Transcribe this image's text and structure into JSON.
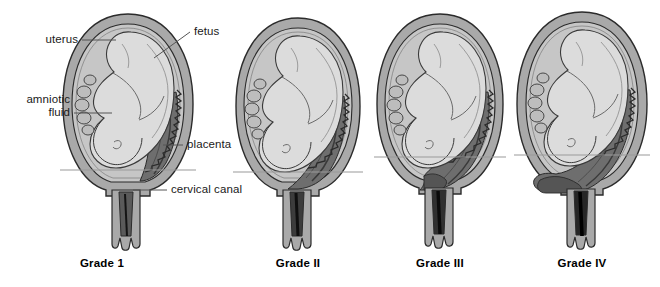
{
  "figure": {
    "background": "#ffffff",
    "panel_count": 4
  },
  "labels": [
    {
      "id": "uterus",
      "text": "uterus",
      "x": 22,
      "y": 36,
      "align": "right",
      "width": 56
    },
    {
      "id": "amniotic",
      "text": "amniotic",
      "x": 8,
      "y": 96,
      "align": "right",
      "width": 62
    },
    {
      "id": "fluid",
      "text": "fluid",
      "x": 8,
      "y": 109,
      "align": "right",
      "width": 62
    },
    {
      "id": "fetus",
      "text": "fetus",
      "x": 193,
      "y": 28,
      "align": "left",
      "width": 40
    },
    {
      "id": "placenta",
      "text": "placenta",
      "x": 186,
      "y": 140,
      "align": "left",
      "width": 60
    },
    {
      "id": "cervical-canal",
      "text": "cervical canal",
      "x": 170,
      "y": 186,
      "align": "left",
      "width": 86
    }
  ],
  "captions": [
    {
      "id": "grade-1",
      "text": "Grade 1",
      "x": 102,
      "y": 263
    },
    {
      "id": "grade-2",
      "text": "Grade II",
      "x": 272,
      "y": 263
    },
    {
      "id": "grade-3",
      "text": "Grade III",
      "x": 414,
      "y": 263
    },
    {
      "id": "grade-4",
      "text": "Grade IV",
      "x": 556,
      "y": 263
    }
  ],
  "colors": {
    "uterus_wall": "#a9a9a9",
    "uterus_wall_dark": "#8f8f8f",
    "amniotic_fluid": "#c8c8c8",
    "fetus": "#dcdcdc",
    "placenta": "#6e6e6e",
    "placenta_dark": "#4a4a4a",
    "cervical_plug": "#1a1a1a",
    "outline": "#2b2b2b",
    "leader_line": "#555555",
    "reference_line": "#9a9a9a",
    "background": "#ffffff"
  },
  "panels": [
    {
      "id": "panel-grade-1",
      "caption": "Grade 1",
      "cx": 128,
      "reference_line_y": 170,
      "placenta_reaches_os": false,
      "description": "Placenta low in uterus but clear of the internal cervical os"
    },
    {
      "id": "panel-grade-2",
      "caption": "Grade II",
      "cx": 298,
      "reference_line_y": 172,
      "placenta_reaches_os": true,
      "description": "Placenta reaches the margin of the internal cervical os"
    },
    {
      "id": "panel-grade-3",
      "caption": "Grade III",
      "cx": 440,
      "reference_line_y": 157,
      "placenta_reaches_os": true,
      "description": "Placenta partially covers the internal cervical os"
    },
    {
      "id": "panel-grade-4",
      "caption": "Grade IV",
      "cx": 582,
      "reference_line_y": 155,
      "placenta_reaches_os": true,
      "description": "Placenta completely covers the internal cervical os"
    }
  ]
}
